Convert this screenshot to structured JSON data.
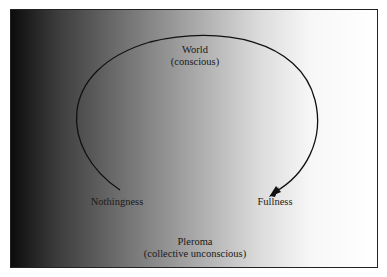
{
  "diagram": {
    "labels": {
      "world": "World",
      "world_sub": "(conscious)",
      "nothingness": "Nothingness",
      "fullness": "Fullness",
      "pleroma": "Pleroma",
      "pleroma_sub": "(collective unconscious)"
    },
    "colors": {
      "gradient_dark": "#0c0c0c",
      "gradient_light": "#ffffff",
      "line": "#111111"
    }
  }
}
